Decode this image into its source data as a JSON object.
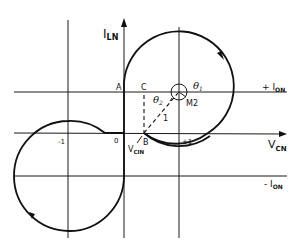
{
  "figure": {
    "type": "phase-plane trajectory diagram",
    "axes": {
      "vertical_label": {
        "main": "I",
        "sub": "LN"
      },
      "horizontal_label": {
        "main": "V",
        "sub": "CN"
      }
    },
    "reference_lines": {
      "plus_ion": {
        "main": "+ I",
        "sub": "ON"
      },
      "minus_ion": {
        "main": "- I",
        "sub": "ON"
      }
    },
    "tick_labels": {
      "minus_one": "-1",
      "origin": "0",
      "plus_one": "+1"
    },
    "points": {
      "A": "A",
      "B": "B",
      "C": "C",
      "M2": "M2"
    },
    "vcin_label": {
      "main": "V",
      "sub": "CIN"
    },
    "angles": {
      "theta1": {
        "main": "θ",
        "sub": "1"
      },
      "theta2": {
        "main": "θ",
        "sub": "2"
      }
    },
    "radius_label": "1",
    "colors": {
      "ink": "#111111",
      "background": "#ffffff"
    }
  }
}
